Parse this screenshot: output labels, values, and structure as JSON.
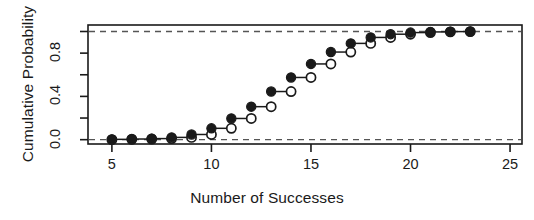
{
  "figure": {
    "background": "#ffffff",
    "ink": "#1a1a1a"
  },
  "axis": {
    "ylabel": "Cumulative Probability",
    "xlabel": "Number of Successes",
    "x_ticks": [
      "5",
      "10",
      "15",
      "20",
      "25"
    ],
    "y_ticks": [
      "0.0",
      "",
      "0.4",
      "",
      "0.8",
      ""
    ]
  },
  "chart_data": {
    "type": "line",
    "title": "",
    "subtitle": "",
    "xlabel": "Number of Successes",
    "ylabel": "Cumulative Probability",
    "xlim": [
      3.8,
      25.6
    ],
    "ylim": [
      -0.04,
      1.06
    ],
    "x_ticks": [
      5,
      10,
      15,
      20,
      25
    ],
    "y_ticks": [
      0.0,
      0.2,
      0.4,
      0.6,
      0.8,
      1.0
    ],
    "y_tick_labels": [
      "0.0",
      "",
      "0.4",
      "",
      "0.8",
      ""
    ],
    "grid": false,
    "legend": null,
    "annotations": [
      {
        "type": "hline",
        "y": 0.0,
        "style": "dashed",
        "color": "#555555"
      },
      {
        "type": "hline",
        "y": 1.0,
        "style": "dashed",
        "color": "#555555"
      }
    ],
    "x": [
      5,
      6,
      7,
      8,
      9,
      10,
      11,
      12,
      13,
      14,
      15,
      16,
      17,
      18,
      19,
      20,
      21,
      22,
      23
    ],
    "series": [
      {
        "name": "closed-endpoint",
        "marker": "filled-circle",
        "values": [
          0.003,
          0.006,
          0.01,
          0.021,
          0.048,
          0.105,
          0.196,
          0.305,
          0.445,
          0.575,
          0.7,
          0.81,
          0.89,
          0.945,
          0.975,
          0.99,
          0.996,
          0.999,
          1.0
        ]
      },
      {
        "name": "open-endpoint",
        "marker": "open-circle",
        "values": [
          0.0,
          0.003,
          0.006,
          0.01,
          0.021,
          0.048,
          0.105,
          0.196,
          0.305,
          0.445,
          0.575,
          0.7,
          0.81,
          0.89,
          0.945,
          0.975,
          0.99,
          0.996,
          0.999
        ]
      }
    ]
  }
}
